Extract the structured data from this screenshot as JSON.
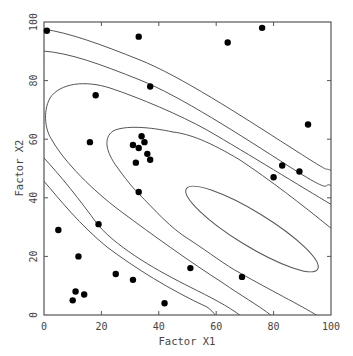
{
  "chart_data": {
    "type": "scatter",
    "title": "",
    "xlabel": "Factor X1",
    "ylabel": "Factor X2",
    "xlim": [
      0,
      100
    ],
    "ylim": [
      0,
      100
    ],
    "xticks": [
      "0",
      "20",
      "40",
      "60",
      "80",
      "100"
    ],
    "yticks": [
      "0",
      "20",
      "40",
      "60",
      "80",
      "100"
    ],
    "grid": false,
    "legend": null,
    "overlay": "contour lines (elliptical level curves of a fitted quadratic response surface, center approx X1=72, X2=30)",
    "points": [
      {
        "x": 1,
        "y": 97
      },
      {
        "x": 33,
        "y": 95
      },
      {
        "x": 64,
        "y": 93
      },
      {
        "x": 76,
        "y": 98
      },
      {
        "x": 37,
        "y": 78
      },
      {
        "x": 18,
        "y": 75
      },
      {
        "x": 92,
        "y": 65
      },
      {
        "x": 16,
        "y": 59
      },
      {
        "x": 34,
        "y": 61
      },
      {
        "x": 35,
        "y": 59
      },
      {
        "x": 31,
        "y": 58
      },
      {
        "x": 33,
        "y": 57
      },
      {
        "x": 36,
        "y": 55
      },
      {
        "x": 37,
        "y": 53
      },
      {
        "x": 32,
        "y": 52
      },
      {
        "x": 33,
        "y": 42
      },
      {
        "x": 83,
        "y": 51
      },
      {
        "x": 89,
        "y": 49
      },
      {
        "x": 80,
        "y": 47
      },
      {
        "x": 19,
        "y": 31
      },
      {
        "x": 5,
        "y": 29
      },
      {
        "x": 12,
        "y": 20
      },
      {
        "x": 51,
        "y": 16
      },
      {
        "x": 25,
        "y": 14
      },
      {
        "x": 69,
        "y": 13
      },
      {
        "x": 31,
        "y": 12
      },
      {
        "x": 11,
        "y": 8
      },
      {
        "x": 14,
        "y": 7
      },
      {
        "x": 10,
        "y": 5
      },
      {
        "x": 42,
        "y": 4
      }
    ]
  }
}
